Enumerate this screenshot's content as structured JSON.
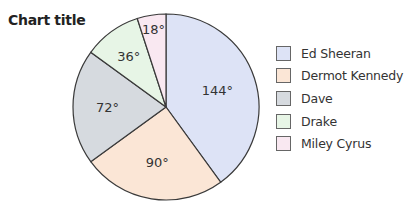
{
  "chart_data": {
    "type": "pie",
    "title": "Chart title",
    "unit": "degrees",
    "categories": [
      "Ed Sheeran",
      "Dermot Kennedy",
      "Dave",
      "Drake",
      "Miley Cyrus"
    ],
    "values": [
      144,
      90,
      72,
      36,
      18
    ],
    "labels": [
      "144°",
      "90°",
      "72°",
      "36°",
      "18°"
    ],
    "colors": [
      "#dde3f6",
      "#fbe6d6",
      "#d6dadf",
      "#e7f5e6",
      "#f9e8f1"
    ],
    "start_angle": "12 o'clock",
    "direction": "clockwise",
    "legend_position": "right"
  },
  "title": "Chart title",
  "legend": [
    {
      "label": "Ed Sheeran",
      "color": "#dde3f6"
    },
    {
      "label": "Dermot Kennedy",
      "color": "#fbe6d6"
    },
    {
      "label": "Dave",
      "color": "#d6dadf"
    },
    {
      "label": "Drake",
      "color": "#e7f5e6"
    },
    {
      "label": "Miley Cyrus",
      "color": "#f9e8f1"
    }
  ]
}
